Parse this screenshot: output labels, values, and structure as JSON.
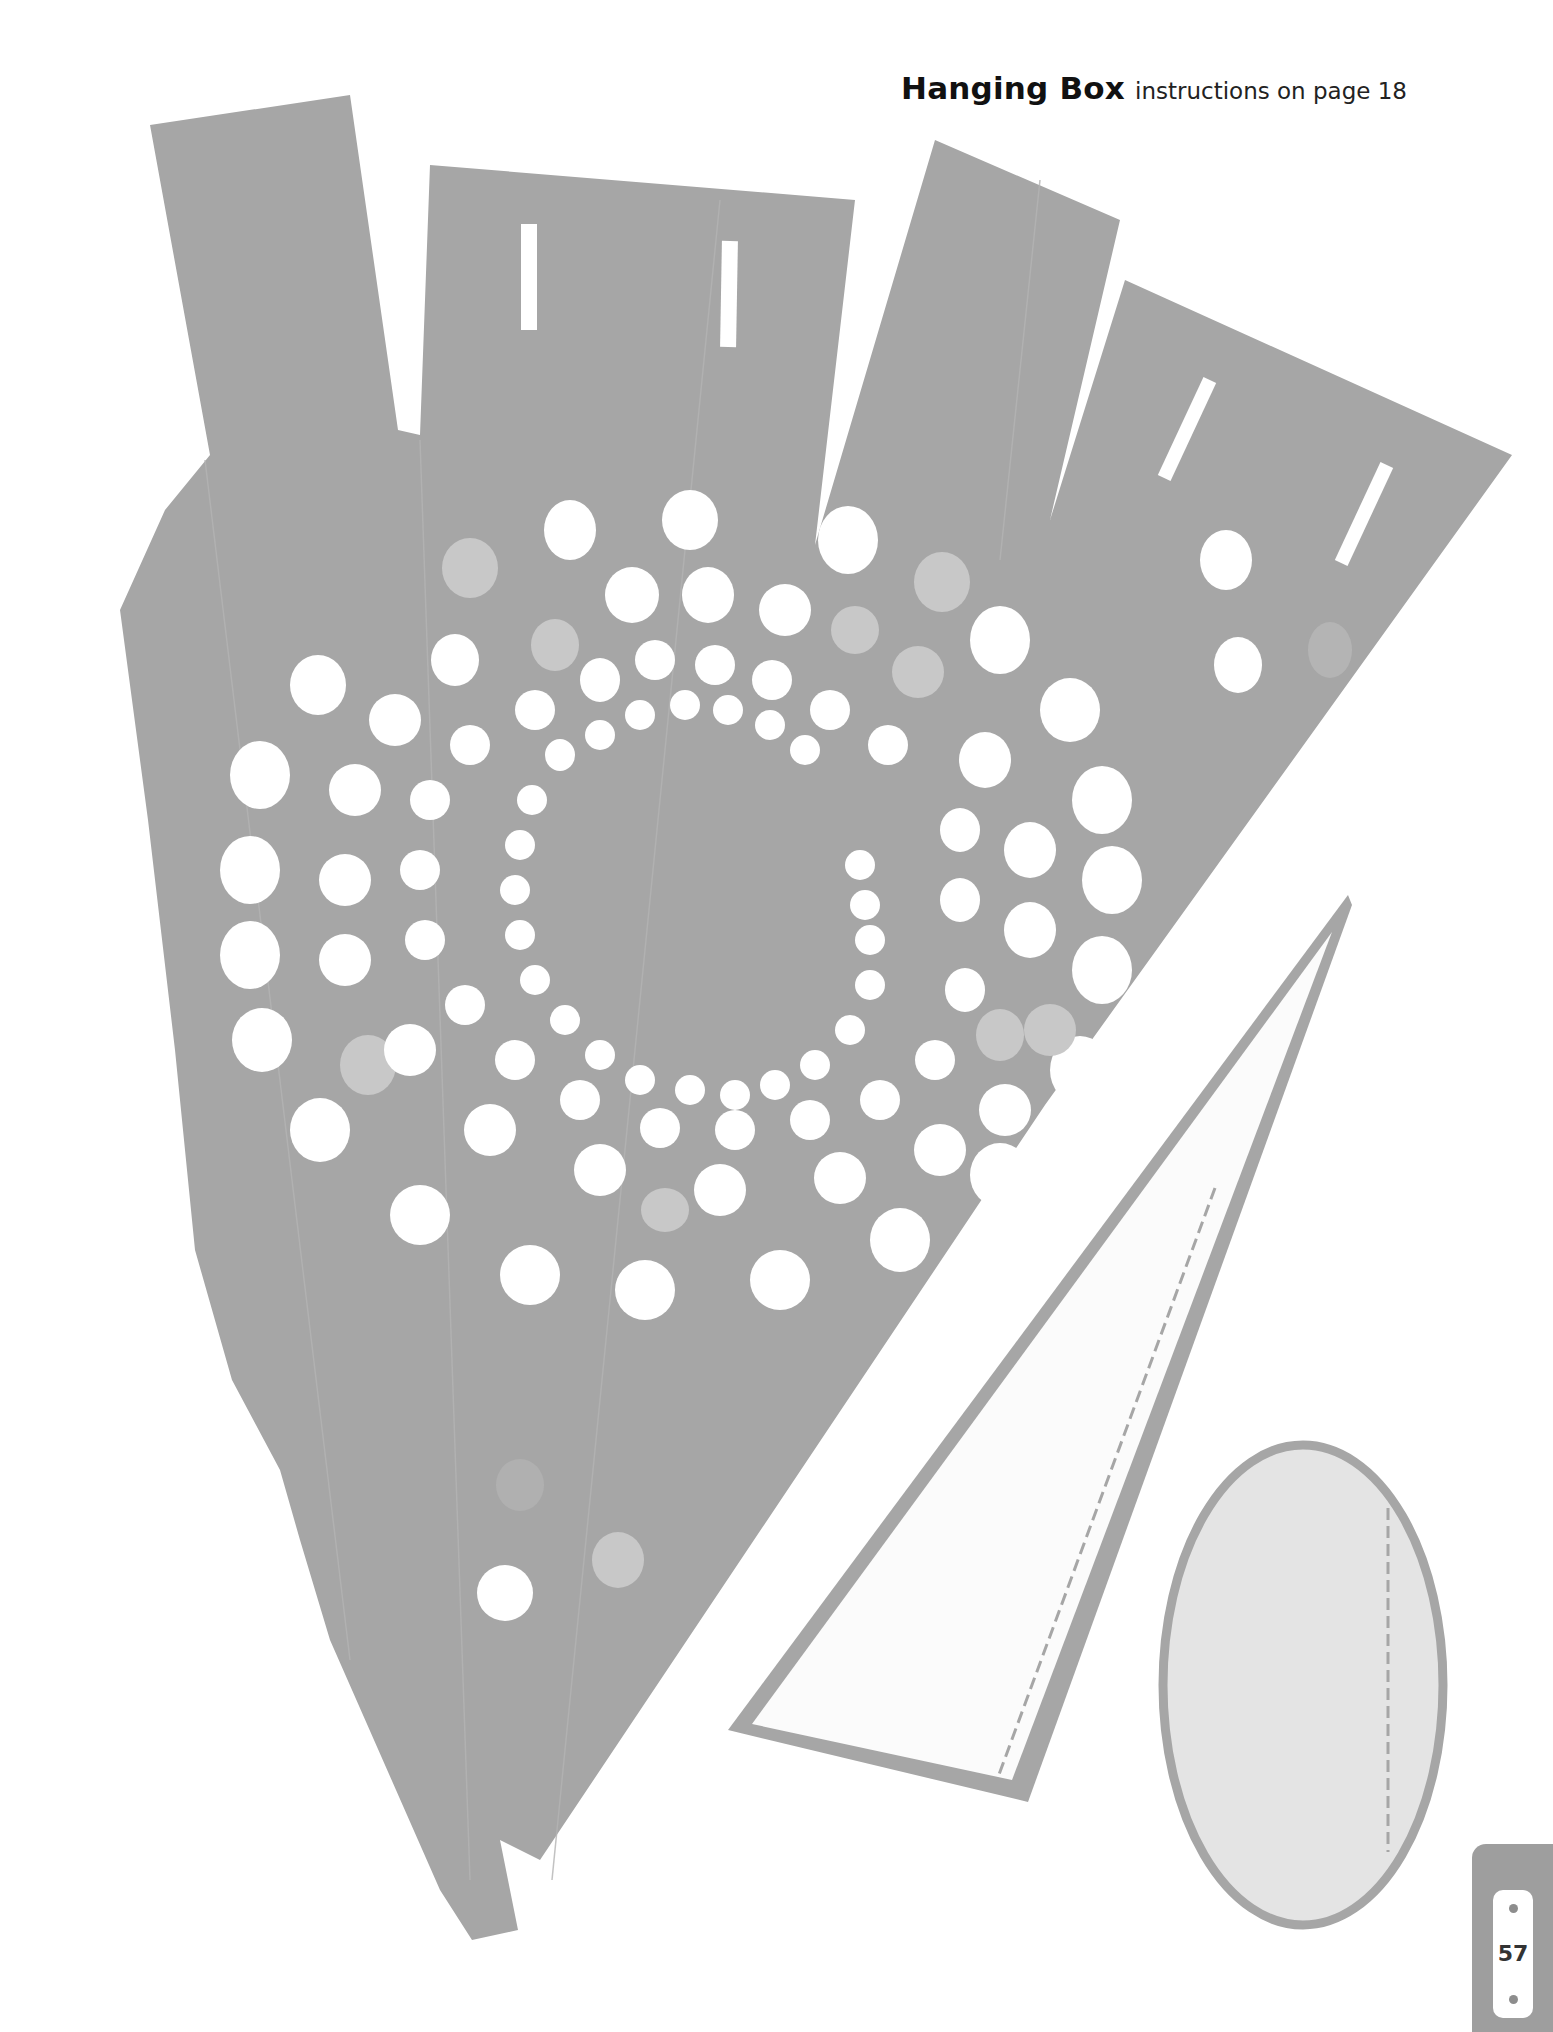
{
  "header": {
    "title": "Hanging Box",
    "subtitle": "instructions on page 18"
  },
  "page": {
    "number": "57"
  },
  "colors": {
    "piece_gray": "#a6a6a6",
    "light_dot": "#c8c8c8",
    "oval_fill": "#e4e4e4",
    "triangle_fill": "#fbfbfb",
    "hole_white": "#ffffff"
  },
  "template_pieces": [
    {
      "id": "box-body",
      "description": "gray die-cut body with four top tabs and concentric dot rings"
    },
    {
      "id": "triangle-flap",
      "description": "white triangle with gray outline and dashed fold line"
    },
    {
      "id": "oval-base",
      "description": "light gray oval with gray outline and dashed fold line"
    }
  ]
}
